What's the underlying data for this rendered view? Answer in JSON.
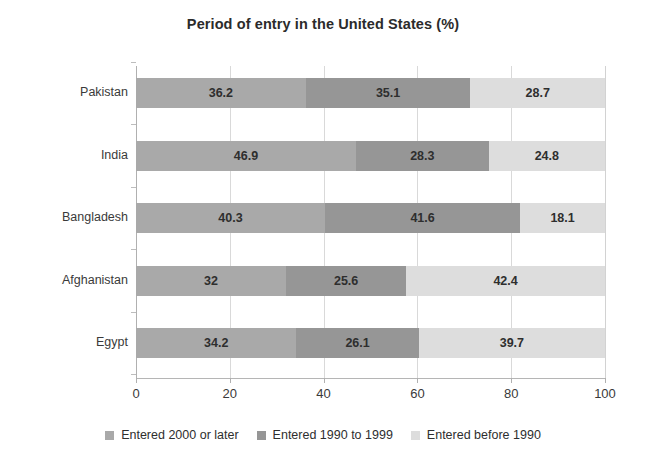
{
  "chart_data": {
    "type": "bar",
    "orientation": "horizontal",
    "stacked": true,
    "title": "Period of entry in the United States (%)",
    "xlabel": "",
    "ylabel": "",
    "xlim": [
      0,
      100
    ],
    "xticks": [
      0,
      20,
      40,
      60,
      80,
      100
    ],
    "xtick_labels": [
      "0",
      "20",
      "40",
      "60",
      "80",
      "100"
    ],
    "grid": true,
    "legend_position": "bottom",
    "categories": [
      "Pakistan",
      "India",
      "Bangladesh",
      "Afghanistan",
      "Egypt"
    ],
    "series": [
      {
        "name": "Entered 2000 or later",
        "color": "#a9a9a9",
        "values": [
          36.2,
          46.9,
          40.3,
          32,
          34.2
        ],
        "labels": [
          "36.2",
          "46.9",
          "40.3",
          "32",
          "34.2"
        ]
      },
      {
        "name": "Entered 1990 to 1999",
        "color": "#969696",
        "values": [
          35.1,
          28.3,
          41.6,
          25.6,
          26.1
        ],
        "labels": [
          "35.1",
          "28.3",
          "41.6",
          "25.6",
          "26.1"
        ]
      },
      {
        "name": "Entered before 1990",
        "color": "#dddddd",
        "values": [
          28.7,
          24.8,
          18.1,
          42.4,
          39.7
        ],
        "labels": [
          "28.7",
          "24.8",
          "18.1",
          "42.4",
          "39.7"
        ]
      }
    ]
  }
}
